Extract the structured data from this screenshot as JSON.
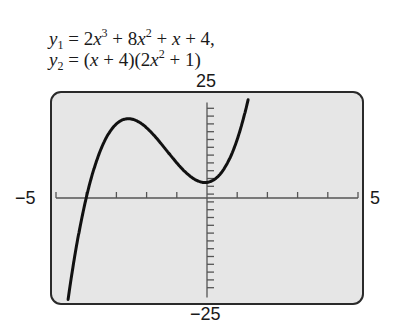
{
  "equations": {
    "eq1": {
      "lhs": "y",
      "sub": "1",
      "rhs_parts": [
        "2",
        "x",
        "3",
        " + 8",
        "x",
        "2",
        " + ",
        "x",
        " + 4,"
      ]
    },
    "eq2": {
      "lhs": "y",
      "sub": "2",
      "rhs_parts": [
        "(",
        "x",
        " + 4)(2",
        "x",
        "2",
        " + 1)"
      ]
    }
  },
  "window_labels": {
    "ymax": "25",
    "ymin": "−25",
    "xmin": "−5",
    "xmax": "5"
  },
  "colors": {
    "screen_bg": "#e6e6e6",
    "frame": "#2a2a2a",
    "axis": "#555555",
    "curve": "#111111"
  },
  "chart_data": {
    "type": "line",
    "function": "2x^3 + 8x^2 + x + 4",
    "xlabel": "",
    "ylabel": "",
    "xlim": [
      -5,
      5
    ],
    "ylim": [
      -25,
      25
    ],
    "xscale_ticks": 1,
    "yscale_ticks": 2,
    "grid": false,
    "legend": null,
    "series": [
      {
        "name": "y1 = y2",
        "x": [
          -4.6,
          -4.5,
          -4.0,
          -3.5,
          -3.0,
          -2.6,
          -2.0,
          -1.5,
          -1.0,
          -0.5,
          -0.06,
          0.0,
          0.5,
          1.0,
          1.35
        ],
        "y": [
          -26.0,
          -18.0,
          0.0,
          11.75,
          19.0,
          20.3,
          18.0,
          13.75,
          9.0,
          5.25,
          3.97,
          4.0,
          6.75,
          15.0,
          24.85
        ]
      }
    ],
    "annotations": [
      {
        "label": "local max",
        "x": -2.6,
        "y": 20.3
      },
      {
        "label": "local min",
        "x": -0.06,
        "y": 3.97
      },
      {
        "label": "x-intercept",
        "x": -4,
        "y": 0
      }
    ]
  }
}
